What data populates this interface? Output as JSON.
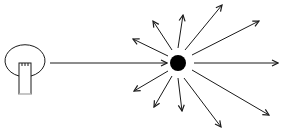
{
  "diagram": {
    "colors": {
      "stroke": "#1a1a1a",
      "background": "#ffffff",
      "particle": "#000000"
    },
    "source": {
      "type": "light-bulb",
      "cx": 22,
      "cy": 60,
      "rx": 20,
      "ry": 16
    },
    "beam": {
      "x1": 50,
      "y1": 63,
      "x2": 167,
      "y2": 63
    },
    "particle": {
      "cx": 178,
      "cy": 63,
      "r": 8
    },
    "scattered_rays": [
      {
        "name": "right",
        "x1": 194,
        "y1": 63,
        "x2": 278,
        "y2": 63
      },
      {
        "name": "upper-right",
        "x1": 192,
        "y1": 55,
        "x2": 259,
        "y2": 21
      },
      {
        "name": "up-right",
        "x1": 185,
        "y1": 50,
        "x2": 222,
        "y2": 5
      },
      {
        "name": "up",
        "x1": 178,
        "y1": 48,
        "x2": 183,
        "y2": 15
      },
      {
        "name": "up-left",
        "x1": 172,
        "y1": 50,
        "x2": 153,
        "y2": 21
      },
      {
        "name": "left-up",
        "x1": 168,
        "y1": 56,
        "x2": 133,
        "y2": 39
      },
      {
        "name": "left-down",
        "x1": 168,
        "y1": 71,
        "x2": 134,
        "y2": 91
      },
      {
        "name": "down-left",
        "x1": 172,
        "y1": 76,
        "x2": 154,
        "y2": 107
      },
      {
        "name": "down",
        "x1": 178,
        "y1": 78,
        "x2": 182,
        "y2": 111
      },
      {
        "name": "down-right",
        "x1": 184,
        "y1": 78,
        "x2": 221,
        "y2": 127
      },
      {
        "name": "right-down",
        "x1": 192,
        "y1": 70,
        "x2": 269,
        "y2": 115
      }
    ],
    "caption": ""
  }
}
